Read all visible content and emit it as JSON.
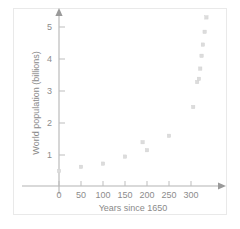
{
  "chart_data": {
    "type": "scatter",
    "title": "",
    "xlabel": "Years since 1650",
    "ylabel": "World population (billions)",
    "xlim": [
      -25,
      355
    ],
    "ylim": [
      0,
      5.6
    ],
    "xticks": [
      0,
      50,
      100,
      150,
      200,
      250,
      300
    ],
    "yticks": [
      1,
      2,
      3,
      4,
      5
    ],
    "xtick_labels": [
      "0",
      "50",
      "100",
      "150",
      "200",
      "250",
      "300"
    ],
    "ytick_labels": [
      "1",
      "2",
      "3",
      "4",
      "5"
    ],
    "grid": false,
    "legend": false,
    "points": [
      {
        "x": 0,
        "y": 0.5
      },
      {
        "x": 50,
        "y": 0.63
      },
      {
        "x": 100,
        "y": 0.73
      },
      {
        "x": 150,
        "y": 0.95
      },
      {
        "x": 190,
        "y": 1.4
      },
      {
        "x": 200,
        "y": 1.15
      },
      {
        "x": 250,
        "y": 1.6
      },
      {
        "x": 305,
        "y": 2.5
      },
      {
        "x": 314,
        "y": 3.28
      },
      {
        "x": 318,
        "y": 3.38
      },
      {
        "x": 321,
        "y": 3.7
      },
      {
        "x": 324,
        "y": 4.1
      },
      {
        "x": 327,
        "y": 4.45
      },
      {
        "x": 331,
        "y": 4.85
      },
      {
        "x": 335,
        "y": 5.3
      }
    ],
    "marker": "square",
    "marker_color": "#dcdcdc",
    "axis_color": "#b4b4b4",
    "text_color": "#8c8c8c",
    "background_color": "#ffffff"
  }
}
